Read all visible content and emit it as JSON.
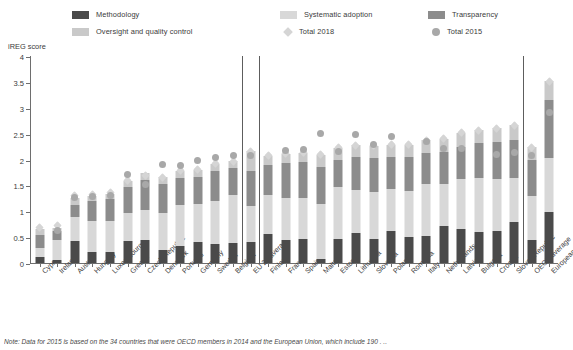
{
  "legend": {
    "columns": [
      {
        "items": [
          {
            "label": "Methodology",
            "marker": "square",
            "color": "#4a4a4a",
            "name": "legend-methodology"
          },
          {
            "label": "Oversight and quality control",
            "marker": "square",
            "color": "#c9c9c9",
            "name": "legend-oversight"
          }
        ]
      },
      {
        "items": [
          {
            "label": "Systematic adoption",
            "marker": "square",
            "color": "#d8d8d8",
            "name": "legend-systematic-adoption"
          },
          {
            "label": "Total 2018",
            "marker": "diamond",
            "color": "#d5d5d5",
            "name": "legend-total-2018"
          }
        ]
      },
      {
        "items": [
          {
            "label": "Transparency",
            "marker": "square",
            "color": "#8c8c8c",
            "name": "legend-transparency"
          },
          {
            "label": "Total 2015",
            "marker": "circle",
            "color": "#a8a8a8",
            "name": "legend-total-2015"
          }
        ]
      }
    ]
  },
  "axis": {
    "ylabel": "iREG score",
    "yticks": [
      "0",
      "0.5",
      "1",
      "1.5",
      "2",
      "2.5",
      "3",
      "3.5",
      "4"
    ]
  },
  "footnote": "Note: Data for 2015 is based on the 34 countries that were OECD members in 2014 and the European Union, which include 190 . ..",
  "chart_data": {
    "type": "bar",
    "title": "",
    "subtitle": "",
    "xlabel": "",
    "ylabel": "iREG score",
    "ylim": [
      0,
      4
    ],
    "yticks": [
      0,
      0.5,
      1,
      1.5,
      2,
      2.5,
      3,
      3.5,
      4
    ],
    "grid": false,
    "legend_position": "top",
    "stacked": true,
    "series_colors": {
      "Methodology": "#4a4a4a",
      "Systematic adoption": "#d8d8d8",
      "Transparency": "#8c8c8c",
      "Oversight and quality control": "#c9c9c9",
      "Total 2018": "#d5d5d5",
      "Total 2015": "#a8a8a8"
    },
    "categories": [
      "Cyprus",
      "Ireland",
      "Austria",
      "Hungary",
      "Luxembourg",
      "Greece",
      "Czech Republic",
      "Denmark",
      "Portugal",
      "Germany",
      "Sweden",
      "Belgium",
      "EU 27 average",
      "Finland",
      "France",
      "Spain",
      "Malta",
      "Estonia",
      "Lithuania",
      "Slovenia",
      "Poland",
      "Romania",
      "Italy",
      "Netherlands",
      "Latvia",
      "Bulgaria",
      "Croatia",
      "Slovak Republic",
      "OECD average",
      "European Union"
    ],
    "series": [
      {
        "name": "Methodology",
        "values": [
          0.12,
          0.05,
          0.43,
          0.22,
          0.21,
          0.43,
          0.44,
          0.25,
          0.32,
          0.4,
          0.36,
          0.39,
          0.4,
          0.57,
          0.44,
          0.47,
          0.07,
          0.47,
          0.58,
          0.46,
          0.62,
          0.51,
          0.53,
          0.72,
          0.65,
          0.6,
          0.62,
          0.79,
          0.44,
          0.98
        ]
      },
      {
        "name": "Systematic adoption",
        "values": [
          0.17,
          0.39,
          0.46,
          0.6,
          0.6,
          0.54,
          0.59,
          0.72,
          0.8,
          0.74,
          0.84,
          0.92,
          0.71,
          0.74,
          0.82,
          0.78,
          1.08,
          1.0,
          0.84,
          0.91,
          0.81,
          0.88,
          0.99,
          0.81,
          0.98,
          1.04,
          1.01,
          0.85,
          0.86,
          1.05
        ]
      },
      {
        "name": "Transparency",
        "values": [
          0.26,
          0.17,
          0.24,
          0.37,
          0.43,
          0.49,
          0.58,
          0.55,
          0.53,
          0.53,
          0.58,
          0.52,
          0.66,
          0.58,
          0.68,
          0.7,
          0.71,
          0.53,
          0.62,
          0.66,
          0.62,
          0.65,
          0.6,
          0.62,
          0.62,
          0.67,
          0.7,
          0.74,
          0.7,
          1.12
        ]
      },
      {
        "name": "Oversight and quality control",
        "values": [
          0.11,
          0.06,
          0.12,
          0.11,
          0.09,
          0.12,
          0.12,
          0.14,
          0.12,
          0.13,
          0.14,
          0.15,
          0.39,
          0.18,
          0.17,
          0.18,
          0.23,
          0.23,
          0.24,
          0.24,
          0.24,
          0.25,
          0.25,
          0.25,
          0.27,
          0.26,
          0.27,
          0.28,
          0.24,
          0.36
        ]
      }
    ],
    "markers": [
      {
        "name": "Total 2018",
        "type": "diamond",
        "values": [
          0.68,
          0.72,
          1.3,
          1.32,
          1.36,
          1.59,
          1.7,
          1.65,
          1.79,
          1.81,
          1.93,
          1.97,
          2.16,
          2.07,
          2.12,
          2.14,
          2.09,
          2.23,
          2.28,
          2.27,
          2.29,
          2.29,
          2.37,
          2.4,
          2.52,
          2.57,
          2.6,
          2.66,
          2.24,
          3.51
        ]
      },
      {
        "name": "Total 2015",
        "type": "circle",
        "values": [
          null,
          0.62,
          1.26,
          1.28,
          1.3,
          1.72,
          1.52,
          1.9,
          1.88,
          1.98,
          2.03,
          2.07,
          2.07,
          null,
          2.17,
          2.19,
          2.5,
          2.16,
          2.49,
          2.29,
          2.44,
          null,
          2.34,
          2.21,
          2.22,
          null,
          2.1,
          2.13,
          2.07,
          2.91
        ]
      }
    ]
  }
}
